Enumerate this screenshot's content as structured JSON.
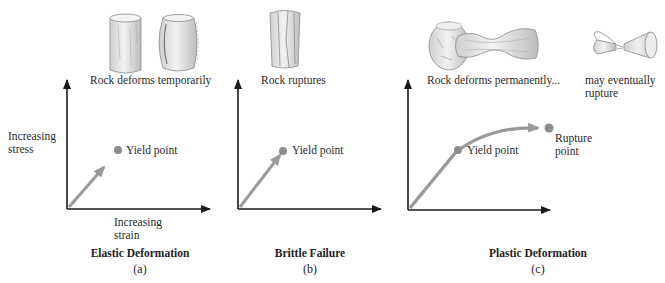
{
  "figure": {
    "panels": [
      {
        "id": "a",
        "caption": "Elastic Deformation",
        "letter": "(a)",
        "rock_caption": "Rock deforms temporarily",
        "rock_images": [
          "intact-cylinder",
          "bulged-cylinder"
        ],
        "y_axis_label_line1": "Increasing",
        "y_axis_label_line2": "stress",
        "x_axis_label_line1": "Increasing",
        "x_axis_label_line2": "strain",
        "points": [
          {
            "label": "Yield point"
          }
        ]
      },
      {
        "id": "b",
        "caption": "Brittle Failure",
        "letter": "(b)",
        "rock_caption": "Rock ruptures",
        "rock_images": [
          "fractured-cylinder"
        ],
        "points": [
          {
            "label": "Yield point"
          }
        ]
      },
      {
        "id": "c",
        "caption": "Plastic Deformation",
        "letter": "(c)",
        "rock_caption": "Rock deforms permanently...",
        "rock_caption_2_line1": "may eventually",
        "rock_caption_2_line2": "rupture",
        "rock_images": [
          "barrel-rock",
          "necked-rock",
          "ruptured-rock"
        ],
        "points": [
          {
            "label": "Yield point"
          },
          {
            "label_line1": "Rupture",
            "label_line2": "point"
          }
        ]
      }
    ],
    "colors": {
      "axis": "#1a1a1a",
      "curve": "#9a9a9a",
      "point": "#8c8c8c",
      "rock_fill": "#e6e6e6",
      "rock_stroke": "#8a8a8a"
    }
  }
}
